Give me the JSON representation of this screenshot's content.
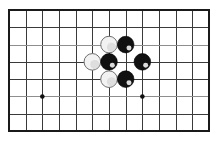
{
  "figure": {
    "title": "Go board position diagram",
    "caption": "",
    "background_color": "#ffffff"
  },
  "board": {
    "columns": 13,
    "rows": 8,
    "origin_x": 9,
    "origin_y": 10,
    "spacing_x": 16.67,
    "spacing_y": 17.29,
    "line_color": "#3a3a3a",
    "light_line_color": "#8e8e8e",
    "border_color": "#1a1a1a",
    "border_width": 2,
    "light_rows": [
      2,
      5
    ],
    "star_points": [
      {
        "col": 2,
        "row": 5
      },
      {
        "col": 8,
        "row": 5
      }
    ],
    "star_point_radius": 2.3,
    "star_point_color": "#111111"
  },
  "stones": {
    "radius": 8.3,
    "black_color": "#111111",
    "white_color": "#f2f2f2",
    "white_edge_color": "#6f6f6f",
    "list": [
      {
        "id": "w1",
        "color": "white",
        "col": 6,
        "row": 2,
        "label": "white-stone"
      },
      {
        "id": "b1",
        "color": "black",
        "col": 7,
        "row": 2,
        "label": "black-stone"
      },
      {
        "id": "w2",
        "color": "white",
        "col": 5,
        "row": 3,
        "label": "white-stone"
      },
      {
        "id": "b2",
        "color": "black",
        "col": 6,
        "row": 3,
        "label": "black-stone"
      },
      {
        "id": "b3",
        "color": "black",
        "col": 8,
        "row": 3,
        "label": "black-stone"
      },
      {
        "id": "w3",
        "color": "white",
        "col": 6,
        "row": 4,
        "label": "white-stone"
      },
      {
        "id": "b4",
        "color": "black",
        "col": 7,
        "row": 4,
        "label": "black-stone"
      }
    ]
  }
}
